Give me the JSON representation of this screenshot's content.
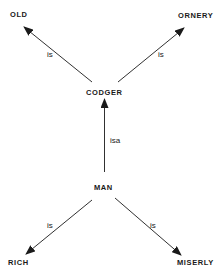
{
  "diagram": {
    "type": "semantic-network",
    "colors": {
      "ink": "#1a1a1a",
      "background": "#ffffff"
    },
    "nodes": {
      "old": "OLD",
      "ornery": "ORNERY",
      "codger": "CODGER",
      "man": "MAN",
      "rich": "RICH",
      "miserly": "MISERLY"
    },
    "edges": [
      {
        "from": "CODGER",
        "to": "OLD",
        "label": "is"
      },
      {
        "from": "CODGER",
        "to": "ORNERY",
        "label": "is"
      },
      {
        "from": "MAN",
        "to": "CODGER",
        "label": "isa"
      },
      {
        "from": "MAN",
        "to": "RICH",
        "label": "is"
      },
      {
        "from": "MAN",
        "to": "MISERLY",
        "label": "is"
      }
    ]
  }
}
